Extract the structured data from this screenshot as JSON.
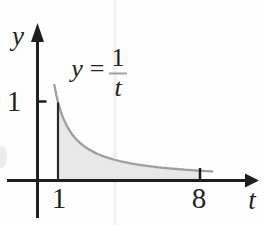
{
  "figure": {
    "colors": {
      "axis": "#1e1e1e",
      "text": "#222222",
      "curve": "#9e9e9e",
      "shade": "#e8e8e8",
      "equation_label": "#a0a0a0",
      "scan_artifact": "#efefef",
      "background": "#fdfdfd"
    },
    "axes": {
      "x_axis_label": "t",
      "y_axis_label": "y",
      "x_tick_1": "1",
      "x_tick_8": "8",
      "y_tick_1": "1"
    },
    "equation_label": {
      "lhs": "y",
      "equals": "=",
      "numerator": "1",
      "denominator": "t"
    }
  },
  "chart_data": {
    "type": "area",
    "title": "",
    "function": "y = 1/t",
    "x": [
      1,
      2,
      3,
      4,
      5,
      6,
      7,
      8
    ],
    "y": [
      1,
      0.5,
      0.333,
      0.25,
      0.2,
      0.167,
      0.143,
      0.125
    ],
    "xlabel": "t",
    "ylabel": "y",
    "x_ticks": [
      1,
      8
    ],
    "y_ticks": [
      1
    ],
    "xlim": [
      0,
      10.9
    ],
    "ylim": [
      0,
      2.0
    ],
    "grid": false,
    "legend": "none",
    "shaded_interval": [
      1,
      8
    ],
    "curve_extent": [
      0.82,
      8.6
    ],
    "annotation": "y = 1/t shown as fraction above the curve; area under curve shaded from t = 1 to t = 8"
  }
}
